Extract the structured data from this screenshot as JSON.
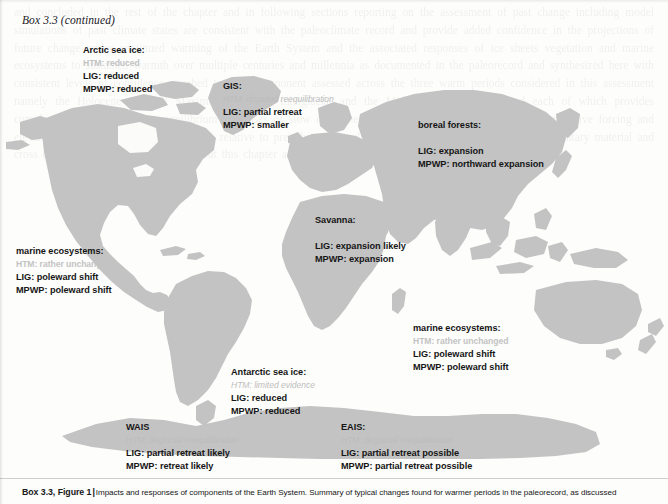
{
  "box": {
    "header": "Box 3.3 (continued)"
  },
  "caption": {
    "lead": "Box 3.3, Figure 1",
    "bar": "|",
    "text": "Impacts and responses of components of the Earth System. Summary of typical changes found for warmer periods in the paleorecord, as discussed"
  },
  "colors": {
    "land": "#c3c3c3",
    "ocean": "#ffffff",
    "label_dark": "#161616",
    "label_faint": "#c3c3c3",
    "page": "#fdfdfc"
  },
  "legend_keys": [
    "HTM",
    "LIG",
    "MPWP"
  ],
  "annotations": [
    {
      "id": "arctic-sea-ice",
      "title": "Arctic sea ice:",
      "htm": "HTM: reduced",
      "htm_italic": false,
      "lig": "LIG: reduced",
      "mpwp": "MPWP: reduced",
      "x": 83,
      "y": 44
    },
    {
      "id": "gis",
      "title": "GIS:",
      "htm": "HTM: disputed reequilibration",
      "htm_italic": true,
      "lig": "LIG: partial retreat",
      "mpwp": "MPWP: smaller",
      "x": 223,
      "y": 80
    },
    {
      "id": "boreal-forests",
      "title": "boreal forests:",
      "htm": "HTM: northward expansion",
      "htm_italic": false,
      "lig": "LIG: expansion",
      "mpwp": "MPWP: northward expansion",
      "x": 418,
      "y": 119
    },
    {
      "id": "savanna",
      "title": "Savanna:",
      "htm": "HTM: expansion",
      "htm_italic": false,
      "lig": "LIG: expansion likely",
      "mpwp": "MPWP: expansion",
      "x": 315,
      "y": 214
    },
    {
      "id": "marine-ecosystems-west",
      "title": "marine ecosystems:",
      "htm": "HTM: rather unchanged",
      "htm_italic": false,
      "lig": "LIG: poleward shift",
      "mpwp": "MPWP: poleward shift",
      "x": 16,
      "y": 245
    },
    {
      "id": "marine-ecosystems-east",
      "title": "marine ecosystems:",
      "htm": "HTM: rather unchanged",
      "htm_italic": false,
      "lig": "LIG: poleward shift",
      "mpwp": "MPWP: poleward shift",
      "x": 413,
      "y": 322
    },
    {
      "id": "antarctic-sea-ice",
      "title": "Antarctic sea ice:",
      "htm": "HTM: limited evidence",
      "htm_italic": true,
      "lig": "LIG: reduced",
      "mpwp": "MPWP: reduced",
      "x": 231,
      "y": 366
    },
    {
      "id": "wais",
      "title": "WAIS",
      "htm": "HTM: deglacial reequilibration",
      "htm_italic": true,
      "lig": "LIG: partial retreat likely",
      "mpwp": "MPWP: retreat likely",
      "x": 126,
      "y": 421
    },
    {
      "id": "eais",
      "title": "EAIS:",
      "htm": "HTM: deglacial reequilibration",
      "htm_italic": true,
      "lig": "LIG: partial retreat possible",
      "mpwp": "MPWP: partial retreat possible",
      "x": 341,
      "y": 421
    }
  ],
  "bleed_text": "and concluded in the rest of the chapter and in following sections reporting on the assessment of past change including model simulations of past climate states are consistent with the paleoclimate record and provide added confidence in the projections of future change under continued warming of the Earth System and the associated responses of ice sheets vegetation and marine ecosystems to sustained warmth over multiple centuries and millennia as documented in the paleorecord and synthesized here with consistent levels of confidence attached to each component assessed across the three warm periods considered in this assessment namely the Holocene Thermal Maximum the Last Interglacial and the Mid Pliocene Warm Period each of which provides complementary constraints on equilibrium responses of slow components of the climate system to sustained radiative forcing and elevated global mean surface temperature relative to preindustrial baselines as further elaborated in the supplementary material and cross chapter boxes referenced throughout this chapter and in the technical summary of this report"
}
